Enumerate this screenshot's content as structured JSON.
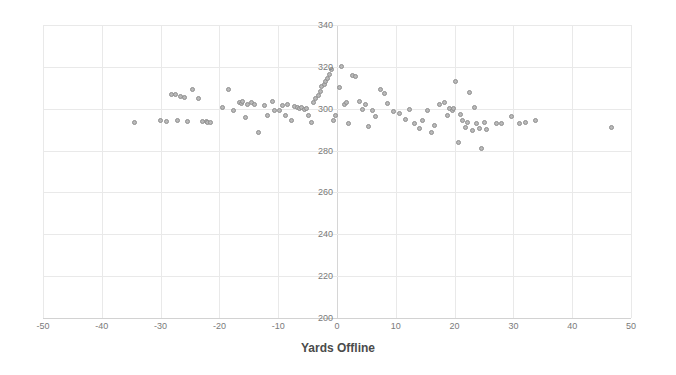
{
  "chart_data": {
    "type": "scatter",
    "title": "",
    "xlabel": "Yards Offline",
    "ylabel": "",
    "xlim": [
      -50,
      50
    ],
    "ylim": [
      200,
      340
    ],
    "xticks": [
      -50,
      -40,
      -30,
      -20,
      -10,
      0,
      10,
      20,
      30,
      40,
      50
    ],
    "xtick_labels": [
      "-50",
      "-40",
      "-30",
      "-20",
      "-10",
      "0",
      "10",
      "20",
      "30",
      "40",
      "50"
    ],
    "yticks": [
      200,
      220,
      240,
      260,
      280,
      300,
      320,
      340
    ],
    "ytick_labels": [
      "200",
      "220",
      "240",
      "260",
      "280",
      "300",
      "320",
      "340"
    ],
    "grid": true,
    "legend": null,
    "marker_color": "#b9b9b9",
    "marker_edge_color": "#8f8f8f",
    "grid_color": "#e9e9e9",
    "axis_color": "#d2d2d2",
    "tick_label_color": "#7a7a7a",
    "points": [
      [
        -34.5,
        293.5
      ],
      [
        -30.0,
        294.2
      ],
      [
        -29.0,
        293.8
      ],
      [
        -28.2,
        307.0
      ],
      [
        -27.5,
        306.8
      ],
      [
        -27.2,
        294.2
      ],
      [
        -26.6,
        306.0
      ],
      [
        -26.0,
        305.6
      ],
      [
        -25.5,
        294.0
      ],
      [
        -24.6,
        309.0
      ],
      [
        -23.6,
        305.0
      ],
      [
        -22.8,
        293.8
      ],
      [
        -22.2,
        294.0
      ],
      [
        -22.0,
        293.5
      ],
      [
        -21.6,
        293.6
      ],
      [
        -19.5,
        300.8
      ],
      [
        -18.4,
        309.4
      ],
      [
        -17.6,
        299.0
      ],
      [
        -16.6,
        303.0
      ],
      [
        -16.2,
        302.6
      ],
      [
        -16.0,
        303.4
      ],
      [
        -15.6,
        296.0
      ],
      [
        -15.2,
        302.0
      ],
      [
        -14.6,
        303.0
      ],
      [
        -14.0,
        302.2
      ],
      [
        -13.4,
        288.5
      ],
      [
        -12.4,
        301.6
      ],
      [
        -11.8,
        297.0
      ],
      [
        -11.0,
        303.6
      ],
      [
        -10.6,
        299.2
      ],
      [
        -9.8,
        299.0
      ],
      [
        -9.2,
        301.4
      ],
      [
        -8.8,
        296.8
      ],
      [
        -8.4,
        302.0
      ],
      [
        -7.8,
        294.2
      ],
      [
        -7.2,
        301.0
      ],
      [
        -6.8,
        300.6
      ],
      [
        -6.4,
        300.2
      ],
      [
        -6.0,
        300.4
      ],
      [
        -5.6,
        299.8
      ],
      [
        -5.2,
        300.0
      ],
      [
        -4.8,
        297.0
      ],
      [
        -4.4,
        293.6
      ],
      [
        -4.0,
        303.2
      ],
      [
        -3.6,
        305.0
      ],
      [
        -3.2,
        306.4
      ],
      [
        -2.8,
        308.2
      ],
      [
        -2.6,
        310.8
      ],
      [
        -2.2,
        311.6
      ],
      [
        -2.0,
        313.0
      ],
      [
        -1.6,
        314.6
      ],
      [
        -1.2,
        316.4
      ],
      [
        -1.0,
        319.0
      ],
      [
        -0.6,
        294.4
      ],
      [
        -0.2,
        296.6
      ],
      [
        0.4,
        310.2
      ],
      [
        0.8,
        320.2
      ],
      [
        1.2,
        302.0
      ],
      [
        1.6,
        303.0
      ],
      [
        2.0,
        293.0
      ],
      [
        2.6,
        315.8
      ],
      [
        3.2,
        315.6
      ],
      [
        3.8,
        303.6
      ],
      [
        4.4,
        299.6
      ],
      [
        4.8,
        302.2
      ],
      [
        5.4,
        291.6
      ],
      [
        6.0,
        299.4
      ],
      [
        6.6,
        296.4
      ],
      [
        7.4,
        309.0
      ],
      [
        8.0,
        307.2
      ],
      [
        8.6,
        302.6
      ],
      [
        9.6,
        298.8
      ],
      [
        10.6,
        297.6
      ],
      [
        11.6,
        294.8
      ],
      [
        12.4,
        299.6
      ],
      [
        13.2,
        292.8
      ],
      [
        14.0,
        290.6
      ],
      [
        14.6,
        294.4
      ],
      [
        15.4,
        299.4
      ],
      [
        16.0,
        288.6
      ],
      [
        16.6,
        292.0
      ],
      [
        17.4,
        302.0
      ],
      [
        18.2,
        303.2
      ],
      [
        18.8,
        296.6
      ],
      [
        19.2,
        300.2
      ],
      [
        19.6,
        299.2
      ],
      [
        19.8,
        300.0
      ],
      [
        20.2,
        312.8
      ],
      [
        20.6,
        284.0
      ],
      [
        21.0,
        297.2
      ],
      [
        21.4,
        294.6
      ],
      [
        21.8,
        291.2
      ],
      [
        22.2,
        293.6
      ],
      [
        22.6,
        307.8
      ],
      [
        23.0,
        289.8
      ],
      [
        23.4,
        300.8
      ],
      [
        23.8,
        293.0
      ],
      [
        24.2,
        290.4
      ],
      [
        24.6,
        281.0
      ],
      [
        25.0,
        293.4
      ],
      [
        25.4,
        290.2
      ],
      [
        27.2,
        292.8
      ],
      [
        28.0,
        293.0
      ],
      [
        29.6,
        296.2
      ],
      [
        31.0,
        293.0
      ],
      [
        32.0,
        293.6
      ],
      [
        33.8,
        294.6
      ],
      [
        46.6,
        291.2
      ]
    ]
  }
}
